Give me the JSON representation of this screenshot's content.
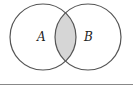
{
  "diagram": {
    "type": "venn",
    "shaded_region": "A ∩ B",
    "sets": [
      {
        "label": "A",
        "cx": 43,
        "cy": 37,
        "r": 33
      },
      {
        "label": "B",
        "cx": 88,
        "cy": 37,
        "r": 33
      }
    ],
    "colors": {
      "stroke": "#555555",
      "fill_intersection": "#d6d6d6",
      "rule": "#888888",
      "background": "#ffffff"
    }
  }
}
